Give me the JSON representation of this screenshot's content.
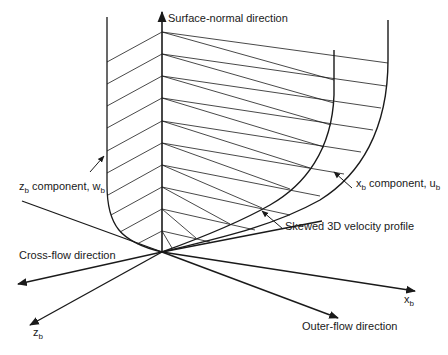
{
  "figure": {
    "type": "diagram",
    "labels": {
      "surface_normal": "Surface-normal direction",
      "z_component_main": "z",
      "z_component_sub": "b",
      "z_component_text": " component, w",
      "z_component_text_sub": "b",
      "x_component_main": "x",
      "x_component_sub": "b",
      "x_component_text": " component, u",
      "x_component_text_sub": "b",
      "skewed_profile": "Skewed 3D velocity profile",
      "cross_flow": "Cross-flow direction",
      "outer_flow": "Outer-flow direction",
      "x_axis_main": "x",
      "x_axis_sub": "b",
      "z_axis_main": "z",
      "z_axis_sub": "b"
    },
    "colors": {
      "ink": "#1a1a1a",
      "background": "#ffffff"
    }
  }
}
